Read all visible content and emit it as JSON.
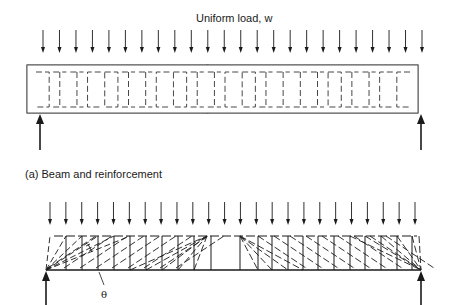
{
  "figure": {
    "load_label": "Uniform load, w",
    "caption_a": "(a) Beam and reinforcement",
    "angle_label": "θ"
  },
  "top_diagram": {
    "load_arrow_count": 24,
    "load_arrow_x_start": 43,
    "load_arrow_x_end": 422,
    "stirrup_shapes": [
      "]",
      "I",
      "I",
      "[",
      "O",
      "I",
      "I",
      "[",
      "O",
      "I",
      "I",
      "[",
      "O",
      "I",
      "I",
      "I",
      "I",
      "O",
      "I",
      "I",
      "[",
      "["
    ],
    "supports": [
      "left-reaction",
      "right-reaction"
    ]
  },
  "bottom_diagram": {
    "load_arrow_count": 24,
    "description": "Truss model with fan struts at supports and inclined compression struts at angle theta",
    "supports": [
      "left-reaction",
      "right-reaction"
    ]
  },
  "colors": {
    "line": "#1a1a1a",
    "stirrup": "#333333",
    "background": "#ffffff"
  }
}
